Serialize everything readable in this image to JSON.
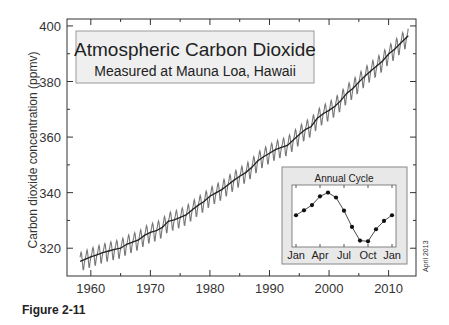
{
  "chart_data": {
    "type": "line",
    "title": "Atmospheric Carbon Dioxide",
    "subtitle": "Measured at Mauna Loa, Hawaii",
    "xlabel": "",
    "ylabel": "Carbon dioxide concentration (ppmv)",
    "xlim": [
      1956,
      2014.6
    ],
    "ylim": [
      310,
      402.5
    ],
    "x_ticks": [
      1960,
      1970,
      1980,
      1990,
      2000,
      2010
    ],
    "y_ticks": [
      320,
      340,
      360,
      380,
      400
    ],
    "grid": false,
    "legend": "none",
    "series": [
      {
        "name": "Annual mean (trend)",
        "color": "#222222",
        "x": [
          1958.2,
          1959,
          1960,
          1961,
          1962,
          1963,
          1964,
          1965,
          1966,
          1967,
          1968,
          1969,
          1970,
          1971,
          1972,
          1973,
          1974,
          1975,
          1976,
          1977,
          1978,
          1979,
          1980,
          1981,
          1982,
          1983,
          1984,
          1985,
          1986,
          1987,
          1988,
          1989,
          1990,
          1991,
          1992,
          1993,
          1994,
          1995,
          1996,
          1997,
          1998,
          1999,
          2000,
          2001,
          2002,
          2003,
          2004,
          2005,
          2006,
          2007,
          2008,
          2009,
          2010,
          2011,
          2012,
          2013.3
        ],
        "values": [
          315.3,
          316.0,
          316.9,
          317.6,
          318.4,
          319.0,
          319.6,
          320.0,
          321.4,
          322.2,
          323.0,
          324.6,
          325.7,
          326.3,
          327.5,
          329.7,
          330.2,
          331.1,
          332.0,
          333.8,
          335.4,
          336.8,
          338.7,
          339.9,
          341.1,
          342.8,
          344.4,
          345.9,
          347.2,
          349.0,
          351.4,
          352.9,
          354.2,
          355.5,
          356.3,
          357.0,
          358.9,
          360.9,
          362.7,
          363.8,
          366.7,
          368.4,
          369.6,
          371.1,
          373.2,
          375.8,
          377.5,
          379.8,
          381.9,
          383.8,
          385.6,
          387.4,
          389.9,
          391.6,
          393.8,
          396.5
        ]
      },
      {
        "name": "Monthly values (seasonal cycle)",
        "color": "#777777",
        "seasonal_amplitude_ppm": 3.3,
        "note": "Monthly values oscillate around the trend following the annual cycle"
      }
    ],
    "inset": {
      "title": "Annual Cycle",
      "type": "line",
      "x_tick_labels": [
        "Jan",
        "Apr",
        "Jul",
        "Oct",
        "Jan"
      ],
      "months": [
        "Jan",
        "Feb",
        "Mar",
        "Apr",
        "May",
        "Jun",
        "Jul",
        "Aug",
        "Sep",
        "Oct",
        "Nov",
        "Dec",
        "Jan"
      ],
      "values": [
        0.0,
        0.65,
        1.35,
        2.5,
        3.0,
        2.35,
        0.6,
        -1.55,
        -3.35,
        -3.45,
        -1.85,
        -0.75,
        0.0
      ],
      "ylim": [
        -4.2,
        4.0
      ]
    }
  },
  "side_note": "April 2013",
  "caption": "Figure 2-11",
  "colors": {
    "axis": "#333333",
    "trend": "#222222",
    "monthly": "#777777",
    "box_fill": "#efefef",
    "box_border": "#999999",
    "inset_fill": "#e8e8e8"
  }
}
